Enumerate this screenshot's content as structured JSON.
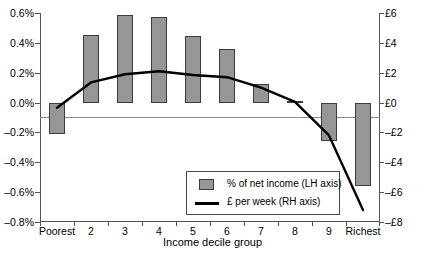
{
  "chart_data": {
    "type": "bar",
    "title": "",
    "xlabel": "Income decile group",
    "ylabel": "",
    "categories": [
      "Poorest",
      "2",
      "3",
      "4",
      "5",
      "6",
      "7",
      "8",
      "9",
      "Richest"
    ],
    "grid": false,
    "legend_position": "inside-bottom-center",
    "axes": {
      "left": {
        "label": "% of net income",
        "ylim": [
          -0.8,
          0.6
        ],
        "tick_values": [
          0.6,
          0.4,
          0.2,
          0.0,
          -0.2,
          -0.4,
          -0.6,
          -0.8
        ],
        "tick_labels": [
          "0.6%",
          "0.4%",
          "0.2%",
          "0.0%",
          "-0.2%",
          "-0.4%",
          "-0.6%",
          "-0.8%"
        ]
      },
      "right": {
        "label": "£ per week",
        "ylim": [
          -8,
          6
        ],
        "tick_values": [
          6,
          4,
          2,
          0,
          -2,
          -4,
          -6,
          -8
        ],
        "tick_labels": [
          "£6",
          "£4",
          "£2",
          "£0",
          "-£2",
          "-£4",
          "-£6",
          "-£8"
        ]
      }
    },
    "series": [
      {
        "name": "% of net income (LH axis)",
        "type": "bar",
        "axis": "left",
        "color": "#969696",
        "values": [
          -0.21,
          0.455,
          0.587,
          0.573,
          0.445,
          0.358,
          0.127,
          0.008,
          -0.255,
          -0.557
        ]
      },
      {
        "name": "£ per week (RH axis)",
        "type": "line",
        "axis": "right",
        "color": "#000000",
        "values": [
          -0.35,
          1.35,
          1.9,
          2.1,
          1.85,
          1.7,
          1.0,
          0.05,
          -2.2,
          -7.2
        ]
      }
    ]
  },
  "legend": {
    "items": [
      {
        "label": "% of net income (LH axis)",
        "marker": "bar-swatch"
      },
      {
        "label": "£ per week (RH axis)",
        "marker": "line-glyph"
      }
    ]
  }
}
